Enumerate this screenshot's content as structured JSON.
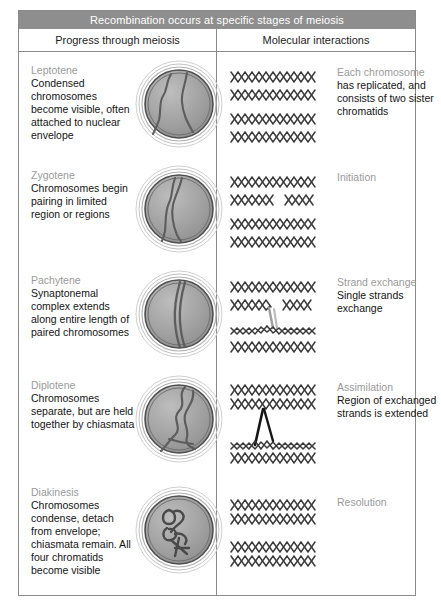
{
  "figure": {
    "title": "Recombination occurs at specific stages of meiosis",
    "columns": {
      "left": "Progress through meiosis",
      "right": "Molecular interactions"
    },
    "colors": {
      "title_bar": "#8e8e8e",
      "title_text": "#ffffff",
      "border": "#8a8a8a",
      "stage_label": "#9a9a9a",
      "body_text": "#141414",
      "nucleus_fill": "#9d9d9d",
      "chromosome": "#5a5a5a",
      "dna_strand": "#3a3a3a"
    }
  },
  "rows": [
    {
      "stage": "Leptotene",
      "description": "Condensed chromosomes become visible, often attached to nuclear envelope",
      "nucleus_icon": "nucleus-leptotene",
      "molecular": {
        "heading": "Each chromosome",
        "description": "has replicated, and consists of two sister chromatids",
        "dna_icon": "dna-four-duplexes-intact"
      }
    },
    {
      "stage": "Zygotene",
      "description": "Chromosomes begin pairing in limited region or regions",
      "nucleus_icon": "nucleus-zygotene",
      "molecular": {
        "heading": "Initiation",
        "description": "",
        "dna_icon": "dna-strand-nick"
      }
    },
    {
      "stage": "Pachytene",
      "description": "Synaptonemal complex extends along entire length of paired chromosomes",
      "nucleus_icon": "nucleus-pachytene",
      "molecular": {
        "heading": "Strand exchange",
        "description": "Single strands exchange",
        "dna_icon": "dna-single-strand-crossover"
      }
    },
    {
      "stage": "Diplotene",
      "description": "Chromosomes separate, but are held together by chiasmata",
      "nucleus_icon": "nucleus-diplotene",
      "molecular": {
        "heading": "Assimilation",
        "description": "Region of exchanged strands is extended",
        "dna_icon": "dna-extended-heteroduplex"
      }
    },
    {
      "stage": "Diakinesis",
      "description": "Chromosomes condense, detach from envelope; chiasmata remain. All four chromatids become visible",
      "nucleus_icon": "nucleus-diakinesis",
      "molecular": {
        "heading": "Resolution",
        "description": "",
        "dna_icon": "dna-resolved-duplexes"
      }
    }
  ]
}
